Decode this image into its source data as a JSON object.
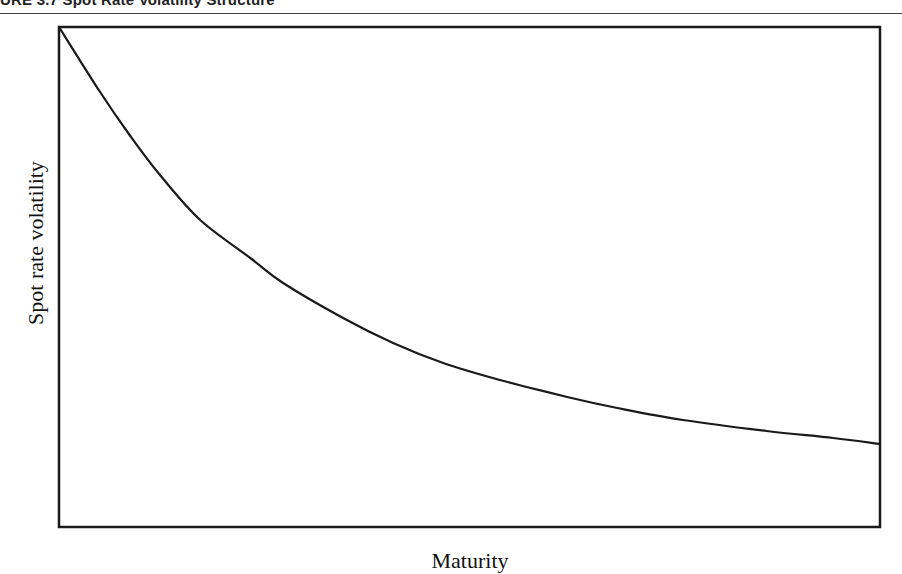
{
  "figure": {
    "title": "URE 3.7   Spot Rate Volatility Structure"
  },
  "chart_data": {
    "type": "line",
    "title": "Spot Rate Volatility Structure",
    "xlabel": "Maturity",
    "ylabel": "Spot rate volatility",
    "x_ticks": [],
    "y_ticks": [],
    "grid": false,
    "legend": null,
    "xlim": [
      0,
      1
    ],
    "ylim": [
      0,
      1
    ],
    "note": "Schematic curve, no numeric ticks; values normalized to plot area",
    "series": [
      {
        "name": "Spot rate volatility",
        "color": "#1a1a1a",
        "x": [
          0,
          0.05,
          0.086,
          0.123,
          0.172,
          0.233,
          0.273,
          0.346,
          0.407,
          0.468,
          0.537,
          0.619,
          0.68,
          0.76,
          0.862,
          0.943,
          1.0
        ],
        "y": [
          1.0,
          0.87,
          0.784,
          0.704,
          0.614,
          0.538,
          0.488,
          0.418,
          0.368,
          0.328,
          0.294,
          0.26,
          0.238,
          0.214,
          0.192,
          0.178,
          0.166
        ]
      }
    ]
  },
  "plot_area": {
    "left": 59,
    "top": 27,
    "right": 880,
    "bottom": 527
  }
}
